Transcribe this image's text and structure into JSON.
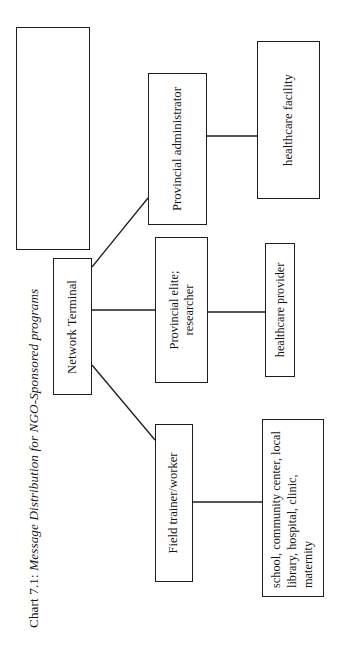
{
  "caption": {
    "lead": "Chart 7.1: ",
    "title": "Message Distribution  for NGO-Sponsored programs",
    "full": "Chart 7.1: Message Distribution  for NGO-Sponsored programs"
  },
  "diagram": {
    "type": "org-tree",
    "orientation": "rotated-90-ccw",
    "nodes": {
      "placeholder": "",
      "root": "Network Terminal",
      "branch_admin": "Provincial administrator",
      "branch_elite": "Provincial elite; researcher",
      "branch_field": "Field trainer/worker",
      "leaf_facility": "healthcare facility",
      "leaf_provider": "healthcare provider",
      "leaf_services": "school, community center, local library, hospital, clinic, maternity"
    },
    "edges": [
      {
        "from": "root",
        "to": "branch_admin"
      },
      {
        "from": "root",
        "to": "branch_elite"
      },
      {
        "from": "root",
        "to": "branch_field"
      },
      {
        "from": "branch_admin",
        "to": "leaf_facility"
      },
      {
        "from": "branch_elite",
        "to": "leaf_provider"
      },
      {
        "from": "branch_field",
        "to": "leaf_services"
      }
    ],
    "colors": {
      "stroke": "#1d1d1d",
      "background": "#ffffff",
      "text": "#151515"
    }
  }
}
